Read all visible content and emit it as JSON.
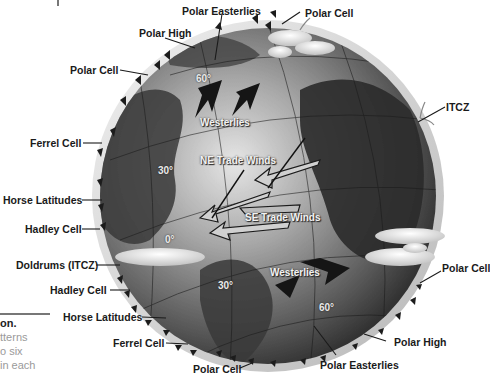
{
  "diagram": {
    "outer_labels": {
      "polar_easterlies_top": "Polar Easterlies",
      "polar_cell_top_right": "Polar Cell",
      "polar_high_top": "Polar High",
      "polar_cell_top_left": "Polar Cell",
      "itcz": "ITCZ",
      "ferrel_cell_top": "Ferrel Cell",
      "horse_latitudes_top": "Horse Latitudes",
      "hadley_cell_top": "Hadley Cell",
      "doldrums": "Doldrums (ITCZ)",
      "hadley_cell_bottom": "Hadley Cell",
      "horse_latitudes_bottom": "Horse Latitudes",
      "ferrel_cell_bottom": "Ferrel Cell",
      "polar_cell_bottom": "Polar Cell",
      "polar_cell_bottom_right": "Polar Cell",
      "polar_high_bottom": "Polar High",
      "polar_easterlies_bottom": "Polar Easterlies"
    },
    "globe_labels": {
      "westerlies_north": "Westerlies",
      "ne_trade_winds": "NE Trade Winds",
      "se_trade_winds": "SE Trade Winds",
      "westerlies_south": "Westerlies"
    },
    "latitudes": {
      "n60": "60°",
      "n30": "30°",
      "eq": "0°",
      "s30": "30°",
      "s60": "60°"
    },
    "colors": {
      "globe_dark": "#2e2e2e",
      "globe_mid": "#8a8a8a",
      "globe_light": "#d8d8d8",
      "ring": "#cfcfcf",
      "label": "#1a1a1a",
      "arrow": "#1c1c1c"
    }
  },
  "caption": {
    "title_fragment": "on.",
    "lines": [
      "tterns",
      "o six",
      "in each"
    ]
  }
}
